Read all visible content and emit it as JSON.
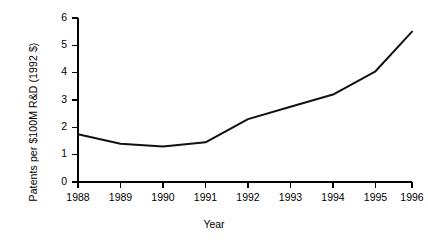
{
  "chart_data": {
    "type": "line",
    "title": "",
    "subtitle": "",
    "xlabel": "Year",
    "ylabel": "Patents per $100M R&D (1992 $)",
    "categories": [
      "1988",
      "1989",
      "1990",
      "1991",
      "1992",
      "1993",
      "1994",
      "1995",
      "1996"
    ],
    "x": [
      1988,
      1989,
      1990,
      1991,
      1992,
      1993,
      1994,
      1995,
      1996
    ],
    "values": [
      1.75,
      1.4,
      1.3,
      1.45,
      2.3,
      2.75,
      3.2,
      4.05,
      5.5
    ],
    "series": [
      {
        "name": "Patents per $100M R&D",
        "values": [
          1.75,
          1.4,
          1.3,
          1.45,
          2.3,
          2.75,
          3.2,
          4.05,
          5.5
        ]
      }
    ],
    "ylim": [
      0,
      6
    ],
    "yticks": [
      0,
      1,
      2,
      3,
      4,
      5,
      6
    ],
    "ytick_labels": [
      "0",
      "1",
      "2",
      "3",
      "4",
      "5",
      "6"
    ],
    "xtick_labels": [
      "1988",
      "1989",
      "1990",
      "1991",
      "1992",
      "1993",
      "1994",
      "1995",
      "1996"
    ],
    "grid": false,
    "legend": false,
    "legend_position": "none",
    "line_color": "#111111",
    "background_color": "#ffffff",
    "annotations": []
  },
  "axes": {
    "y_title": "Patents per $100M R&D (1992 $)",
    "x_title": "Year"
  }
}
